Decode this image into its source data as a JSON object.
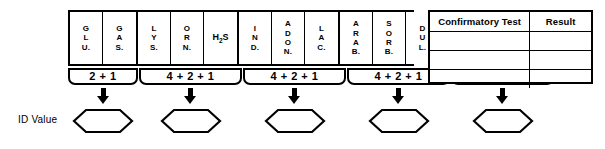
{
  "worksheet": {
    "id_value_label": "ID Value",
    "test_groups": [
      {
        "name": "group-1",
        "value_label": "2 + 1",
        "cells": [
          {
            "label": "G\nL\nU.",
            "name": "glucose",
            "orientation": "vertical"
          },
          {
            "label": "G\nA\nS.",
            "name": "gas",
            "orientation": "vertical"
          }
        ]
      },
      {
        "name": "group-2",
        "value_label": "4 + 2 + 1",
        "cells": [
          {
            "label": "L\nY\nS.",
            "name": "lysine",
            "orientation": "vertical"
          },
          {
            "label": "O\nR\nN.",
            "name": "ornithine",
            "orientation": "vertical"
          },
          {
            "label": "H2S",
            "name": "hydrogen-sulfide",
            "orientation": "horizontal"
          }
        ]
      },
      {
        "name": "group-3",
        "value_label": "4 + 2 + 1",
        "cells": [
          {
            "label": "I\nN\nD.",
            "name": "indole",
            "orientation": "vertical"
          },
          {
            "label": "A\nD\nO\nN.",
            "name": "adonitol",
            "orientation": "vertical"
          },
          {
            "label": "L\nA\nC.",
            "name": "lactose",
            "orientation": "vertical"
          }
        ]
      },
      {
        "name": "group-4",
        "value_label": "4 + 2 + 1",
        "cells": [
          {
            "label": "A\nR\nA\nB.",
            "name": "arabinose",
            "orientation": "vertical"
          },
          {
            "label": "S\nO\nR\nB.",
            "name": "sorbitol",
            "orientation": "vertical"
          },
          {
            "label": "D\nU\nL.",
            "name": "dulcitol",
            "orientation": "vertical"
          }
        ]
      },
      {
        "name": "group-5",
        "value_label": "4 + 2 + 1",
        "cells": [
          {
            "label": "P.\nA.",
            "name": "phenylalanine",
            "orientation": "vertical"
          },
          {
            "label": "U\nR\nE\nA",
            "name": "urea",
            "orientation": "vertical"
          },
          {
            "label": "C\nI\nT.",
            "name": "citrate",
            "orientation": "vertical"
          }
        ]
      }
    ],
    "id_value_entries": [
      "",
      "",
      "",
      "",
      ""
    ]
  },
  "confirmatory_table": {
    "headers": [
      "Confirmatory Test",
      "Result"
    ],
    "rows": [
      {
        "test": "",
        "result": ""
      },
      {
        "test": "",
        "result": ""
      },
      {
        "test": "",
        "result": ""
      }
    ]
  },
  "colors": {
    "ink": "#000000",
    "paper": "#ffffff"
  }
}
